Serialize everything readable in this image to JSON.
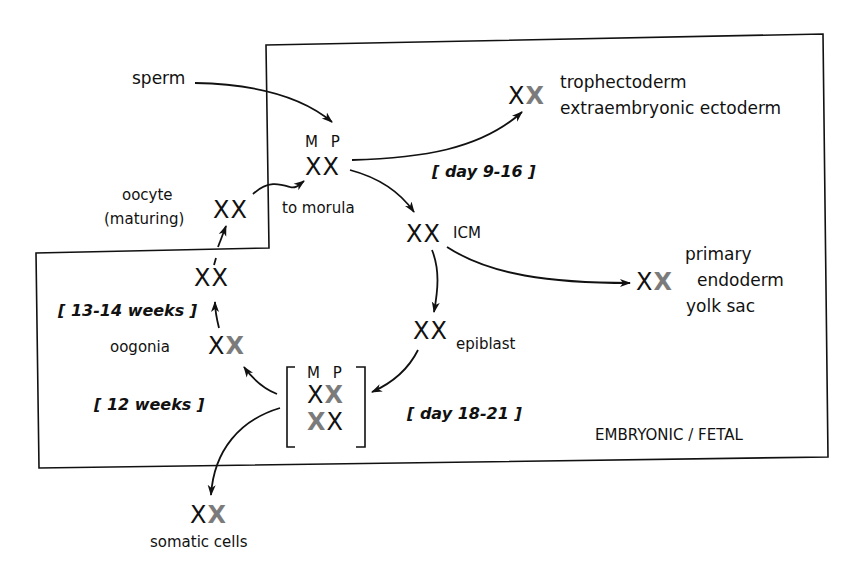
{
  "diagram": {
    "region_label": "EMBRYONIC / FETAL",
    "nodes": {
      "sperm": {
        "label": "sperm"
      },
      "zygote": {
        "parent_label": "M P",
        "chromosomes": "XX",
        "caption": "to morula"
      },
      "oocyte": {
        "label_line1": "oocyte",
        "label_line2": "(maturing)",
        "chromosomes": "XX"
      },
      "trophectoderm": {
        "chromosomes": "X",
        "inactive": "X",
        "label_line1": "trophectoderm",
        "label_line2": "extraembryonic ectoderm"
      },
      "icm": {
        "chromosomes": "XX",
        "label": "ICM"
      },
      "primary_endoderm": {
        "chromosomes": "X",
        "inactive": "X",
        "label_line1": "primary",
        "label_line2": "endoderm",
        "label_line3": "yolk sac"
      },
      "epiblast": {
        "chromosomes": "XX",
        "label": "epiblast"
      },
      "mosaic": {
        "parent_label": "M P",
        "row1_active": "X",
        "row1_inactive": "X",
        "row2_inactive": "X",
        "row2_active": "X"
      },
      "oogonia": {
        "label": "oogonia",
        "chromosomes": "X",
        "inactive": "X"
      },
      "reactivated": {
        "chromosomes": "XX"
      },
      "somatic": {
        "chromosomes": "X",
        "inactive": "X",
        "label": "somatic cells"
      }
    },
    "timing": {
      "day_9_16": "[ day 9-16 ]",
      "day_18_21": "[ day 18-21 ]",
      "weeks_12": "[ 12 weeks ]",
      "weeks_13_14": "[ 13-14 weeks ]"
    }
  }
}
